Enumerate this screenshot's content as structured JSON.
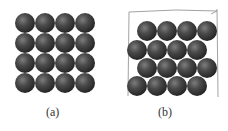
{
  "figure": {
    "panels": [
      {
        "id": "a",
        "label": "(a)",
        "arrangement": "square packing",
        "rows": 4,
        "cols": 4,
        "spheres": [
          [
            25,
            23
          ],
          [
            45,
            23
          ],
          [
            65,
            23
          ],
          [
            85,
            23
          ],
          [
            25,
            43
          ],
          [
            45,
            43
          ],
          [
            65,
            43
          ],
          [
            85,
            43
          ],
          [
            25,
            63
          ],
          [
            45,
            63
          ],
          [
            65,
            63
          ],
          [
            85,
            63
          ],
          [
            25,
            83
          ],
          [
            45,
            83
          ],
          [
            65,
            83
          ],
          [
            85,
            83
          ]
        ]
      },
      {
        "id": "b",
        "label": "(b)",
        "arrangement": "offset (hexagonal) packing inside sketched box",
        "rows": 4,
        "cols": 4,
        "spheres": [
          [
            147,
            31
          ],
          [
            167,
            31
          ],
          [
            187,
            31
          ],
          [
            207,
            31
          ],
          [
            137,
            50
          ],
          [
            157,
            50
          ],
          [
            177,
            50
          ],
          [
            197,
            50
          ],
          [
            147,
            68
          ],
          [
            167,
            68
          ],
          [
            187,
            68
          ],
          [
            207,
            68
          ],
          [
            137,
            86
          ],
          [
            157,
            86
          ],
          [
            177,
            86
          ],
          [
            197,
            86
          ]
        ]
      }
    ],
    "sphere_color": "#3c3c3c",
    "sphere_highlight": "#8a8a8a",
    "box_color": "#888888"
  }
}
